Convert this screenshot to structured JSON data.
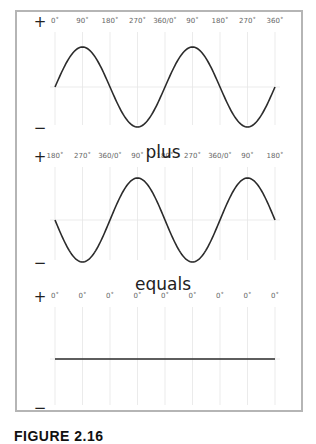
{
  "figure": {
    "caption": "FIGURE 2.16",
    "panels": [
      {
        "name": "wave-a",
        "plus_label": "+",
        "minus_label": "−",
        "phase_labels": [
          "0˚",
          "90˚",
          "180˚",
          "270˚",
          "360/0˚",
          "90˚",
          "180˚",
          "270˚",
          "360˚"
        ],
        "start_phase_deg": 0,
        "cycles": 2
      },
      {
        "name": "wave-b",
        "plus_label": "+",
        "minus_label": "−",
        "phase_labels": [
          "180˚",
          "270˚",
          "360/0˚",
          "90˚",
          "180˚",
          "270˚",
          "360/0˚",
          "90˚",
          "180˚"
        ],
        "start_phase_deg": 180,
        "cycles": 2
      },
      {
        "name": "wave-sum",
        "plus_label": "+",
        "minus_label": "−",
        "phase_labels": [
          "0˚",
          "0˚",
          "0˚",
          "0˚",
          "0˚",
          "0˚",
          "0˚",
          "0˚",
          "0˚"
        ],
        "start_phase_deg": 0,
        "cycles": 0
      }
    ],
    "operators": [
      "plus",
      "equals"
    ]
  },
  "colors": {
    "frame": "#b5b5b5",
    "grid": "#e6e6e6",
    "wave": "#2b2b2b",
    "text": "#222222"
  }
}
